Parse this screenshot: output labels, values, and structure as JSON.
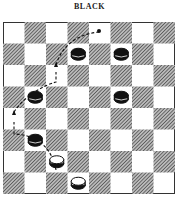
{
  "title": "BLACK",
  "board": {
    "size": 8,
    "light_color": "#ffffff",
    "dark_pattern": "hatched",
    "black_pieces": [
      [
        3,
        1
      ],
      [
        5,
        1
      ],
      [
        1,
        3
      ],
      [
        5,
        3
      ],
      [
        1,
        5
      ]
    ],
    "white_pieces": [
      [
        2,
        6
      ],
      [
        3,
        7
      ]
    ],
    "target_dot": [
      4,
      0
    ]
  },
  "move_path": {
    "description": "White piece jumps: from (2,6) to (0,4), then to (2,2), then to (4,0)",
    "waypoints": [
      [
        2,
        6
      ],
      [
        0,
        4
      ],
      [
        2,
        2
      ],
      [
        4,
        0
      ]
    ]
  }
}
